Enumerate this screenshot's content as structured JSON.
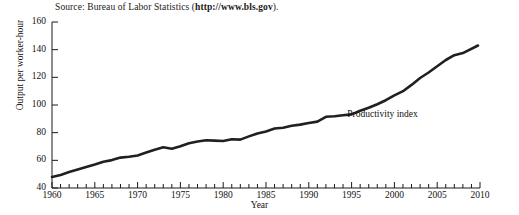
{
  "source": {
    "prefix": "Source: Bureau of Labor Statistics (",
    "url": "http://www.bls.gov",
    "suffix": ")."
  },
  "chart_data": {
    "type": "line",
    "title": "",
    "xlabel": "Year",
    "ylabel": "Output per worker-hour",
    "xlim": [
      1960,
      2010
    ],
    "ylim": [
      40,
      160
    ],
    "grid": false,
    "legend": "none",
    "annotations": [
      {
        "text": "Productivity index",
        "x": 1994.5,
        "y": 93
      }
    ],
    "xticks_major": [
      1960,
      1965,
      1970,
      1975,
      1980,
      1985,
      1990,
      1995,
      2000,
      2005,
      2010
    ],
    "xticks_minor_step": 1,
    "yticks": [
      40,
      60,
      80,
      100,
      120,
      140,
      160
    ],
    "series": [
      {
        "name": "Productivity index",
        "color": "#221f1f",
        "x": [
          1960,
          1961,
          1962,
          1963,
          1964,
          1965,
          1966,
          1967,
          1968,
          1969,
          1970,
          1971,
          1972,
          1973,
          1974,
          1975,
          1976,
          1977,
          1978,
          1979,
          1980,
          1981,
          1982,
          1983,
          1984,
          1985,
          1986,
          1987,
          1988,
          1989,
          1990,
          1991,
          1992,
          1993,
          1994,
          1995,
          1996,
          1997,
          1998,
          1999,
          2000,
          2001,
          2002,
          2003,
          2004,
          2005,
          2006,
          2007,
          2008
        ],
        "values": [
          48.0,
          49.5,
          51.5,
          53.3,
          55.2,
          57.0,
          59.0,
          60.2,
          62.0,
          62.6,
          63.5,
          65.6,
          67.6,
          69.4,
          68.4,
          70.2,
          72.4,
          73.6,
          74.5,
          74.3,
          74.0,
          75.3,
          75.0,
          77.3,
          79.5,
          80.9,
          83.0,
          83.6,
          85.0,
          85.8,
          87.0,
          88.0,
          91.5,
          91.8,
          92.6,
          93.2,
          95.8,
          98.0,
          100.6,
          103.5,
          107.0,
          110.0,
          114.5,
          119.5,
          123.5,
          128.0,
          132.5,
          136.0,
          137.5
        ],
        "end_value": 143.0
      }
    ]
  }
}
